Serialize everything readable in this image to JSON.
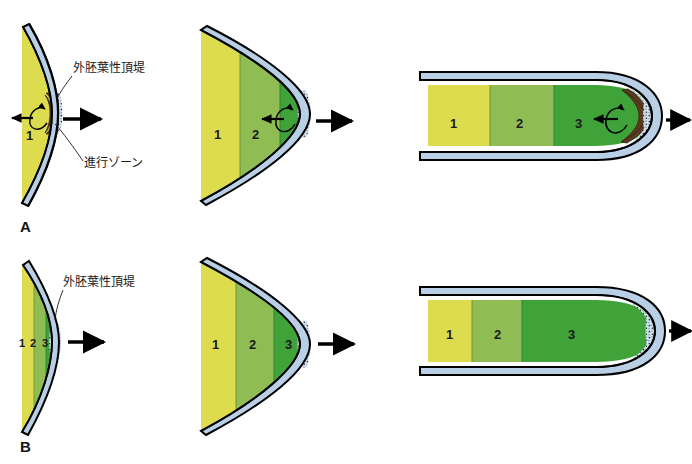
{
  "figure": {
    "title_alt": "",
    "panels": [
      {
        "letter": "A",
        "name": "progress-zone-model",
        "stages": [
          {
            "name": "stage-early",
            "zone_labels": [
              "1"
            ],
            "annotations": [
              "外胚葉性頂堤",
              "進行ゾーン"
            ],
            "has_progress_zone": true,
            "has_recirculating_arrow": true,
            "growth_arrow": "right"
          },
          {
            "name": "stage-mid",
            "zone_labels": [
              "1",
              "2"
            ],
            "annotations": [],
            "has_progress_zone": true,
            "has_recirculating_arrow": true,
            "growth_arrow": "right"
          },
          {
            "name": "stage-late",
            "zone_labels": [
              "1",
              "2",
              "3"
            ],
            "annotations": [],
            "has_progress_zone": true,
            "has_recirculating_arrow": true,
            "growth_arrow": "right"
          }
        ]
      },
      {
        "letter": "B",
        "name": "early-specification-model",
        "stages": [
          {
            "name": "stage-early",
            "zone_labels": [
              "1",
              "2",
              "3"
            ],
            "annotations": [
              "外胚葉性頂堤"
            ],
            "has_progress_zone": false,
            "has_recirculating_arrow": false,
            "growth_arrow": "right"
          },
          {
            "name": "stage-mid",
            "zone_labels": [
              "1",
              "2",
              "3"
            ],
            "annotations": [],
            "has_progress_zone": false,
            "has_recirculating_arrow": false,
            "growth_arrow": "right"
          },
          {
            "name": "stage-late",
            "zone_labels": [
              "1",
              "2",
              "3"
            ],
            "annotations": [],
            "has_progress_zone": false,
            "has_recirculating_arrow": false,
            "growth_arrow": "right"
          }
        ]
      }
    ],
    "labels": {
      "aer": "外胚葉性頂堤",
      "progress_zone": "進行ゾーン",
      "zone1": "1",
      "zone2": "2",
      "zone3": "3",
      "panel_a": "A",
      "panel_b": "B"
    },
    "colors": {
      "zone1": "#dcdc4e",
      "zone2": "#8fbd54",
      "zone3": "#3fa33a",
      "ectoderm": "#b8cfe5",
      "aer_stipple": "#cfe0ef",
      "progress_zone": "#5c3a22",
      "outline": "#000000",
      "background": "#ffffff",
      "text": "#1a1a1a"
    }
  }
}
